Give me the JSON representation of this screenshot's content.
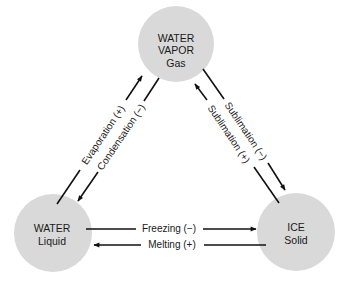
{
  "diagram": {
    "colors": {
      "node_fill": "#d9d9d9",
      "line": "#111111",
      "text": "#1a1a1a",
      "background": "#ffffff"
    },
    "nodes": {
      "vapor": {
        "line1": "WATER",
        "line2": "VAPOR",
        "line3": "Gas"
      },
      "liquid": {
        "line1": "WATER",
        "line2": "Liquid"
      },
      "ice": {
        "line1": "ICE",
        "line2": "Solid"
      }
    },
    "edges": {
      "evaporation": {
        "label": "Evaporation (+)",
        "from": "liquid",
        "to": "vapor"
      },
      "condensation": {
        "label": "Condensation (−)",
        "from": "vapor",
        "to": "liquid"
      },
      "sublimation_minus": {
        "label": "Sublimation (−)",
        "from": "vapor",
        "to": "ice"
      },
      "sublimation_plus": {
        "label": "Sublimation (+)",
        "from": "ice",
        "to": "vapor"
      },
      "freezing": {
        "label": "Freezing (−)",
        "from": "liquid",
        "to": "ice"
      },
      "melting": {
        "label": "Melting (+)",
        "from": "ice",
        "to": "liquid"
      }
    }
  }
}
